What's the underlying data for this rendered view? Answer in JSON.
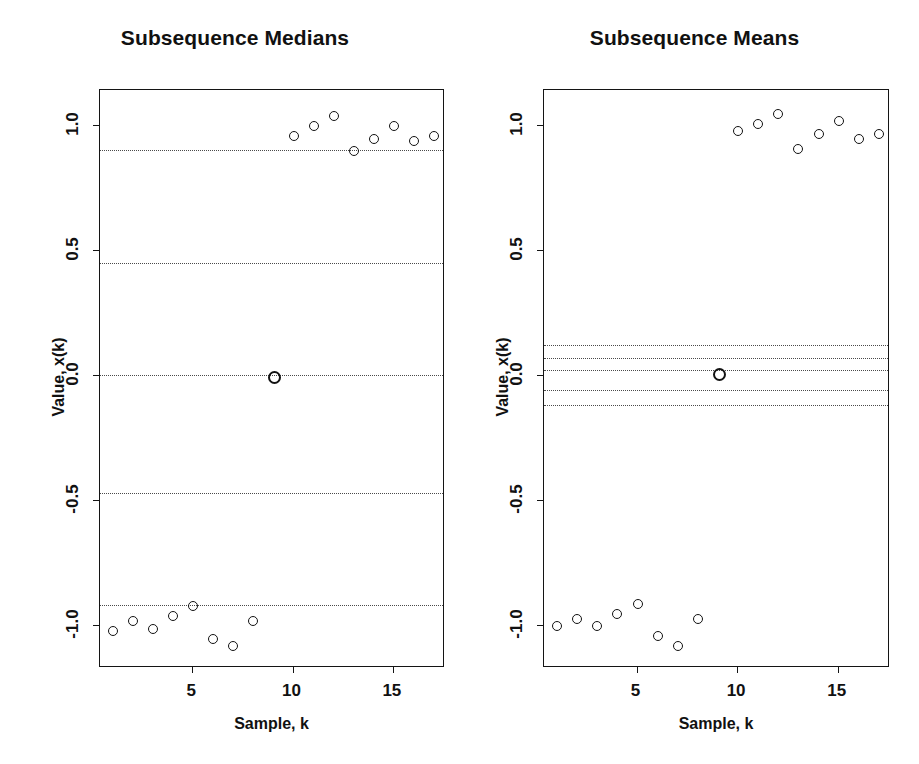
{
  "figure": {
    "width": 919,
    "height": 764,
    "background": "#ffffff",
    "ink_color": "#121212",
    "gridline_color": "#4a4a4a"
  },
  "chart_data": [
    {
      "type": "scatter",
      "title": "Subsequence Medians",
      "xlabel": "Sample, k",
      "ylabel": "Value, x(k)",
      "xlim": [
        0.4,
        17.6
      ],
      "ylim": [
        -1.17,
        1.14
      ],
      "xticks": [
        5,
        10,
        15
      ],
      "xticklabels": [
        "5",
        "10",
        "15"
      ],
      "yticks": [
        1.0,
        0.5,
        0.0,
        -0.5,
        -1.0
      ],
      "yticklabels": [
        "1.0",
        "0.5",
        "0.0",
        "-0.5",
        "-1.0"
      ],
      "grid": false,
      "legend": "none",
      "marker": "open-circle",
      "x": [
        1,
        2,
        3,
        4,
        5,
        6,
        7,
        8,
        9,
        10,
        11,
        12,
        13,
        14,
        15,
        16,
        17
      ],
      "y": [
        -1.02,
        -0.98,
        -1.01,
        -0.96,
        -0.92,
        -1.05,
        -1.08,
        -0.98,
        0.0,
        0.96,
        1.0,
        1.04,
        0.9,
        0.95,
        1.0,
        0.94,
        0.96
      ],
      "reference_lines": {
        "style": "dotted",
        "values": [
          0.9,
          0.45,
          0.0,
          -0.47,
          -0.92
        ]
      }
    },
    {
      "type": "scatter",
      "title": "Subsequence Means",
      "xlabel": "Sample, k",
      "ylabel": "Value, x(k)",
      "xlim": [
        0.4,
        17.6
      ],
      "ylim": [
        -1.17,
        1.14
      ],
      "xticks": [
        5,
        10,
        15
      ],
      "xticklabels": [
        "5",
        "10",
        "15"
      ],
      "yticks": [
        1.0,
        0.5,
        0.0,
        -0.5,
        -1.0
      ],
      "yticklabels": [
        "1.0",
        "0.5",
        "0.0",
        "-0.5",
        "-1.0"
      ],
      "grid": false,
      "legend": "none",
      "marker": "open-circle",
      "x": [
        1,
        2,
        3,
        4,
        5,
        6,
        7,
        8,
        9,
        10,
        11,
        12,
        13,
        14,
        15,
        16,
        17
      ],
      "y": [
        -1.0,
        -0.97,
        -1.0,
        -0.95,
        -0.91,
        -1.04,
        -1.08,
        -0.97,
        0.01,
        0.98,
        1.01,
        1.05,
        0.91,
        0.97,
        1.02,
        0.95,
        0.97
      ],
      "reference_lines": {
        "style": "dotted",
        "values": [
          0.12,
          0.07,
          0.02,
          -0.06,
          -0.12
        ]
      }
    }
  ]
}
